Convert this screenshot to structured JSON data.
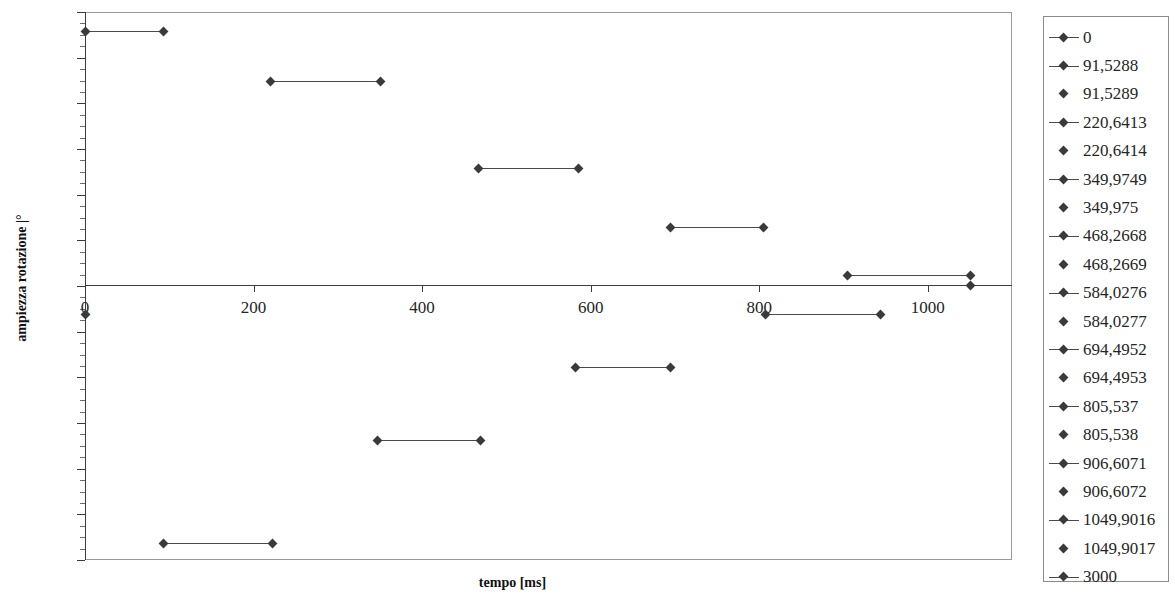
{
  "chart_data": {
    "type": "line",
    "title": "",
    "xlabel": "tempo [ms]",
    "ylabel": "ampiezza rotazione |°",
    "xlim": [
      0,
      1100
    ],
    "ylim": [
      -120,
      120
    ],
    "grid": false,
    "legend_position": "right",
    "x_ticks": [
      {
        "value": 0,
        "label": "0"
      },
      {
        "value": 200,
        "label": "200"
      },
      {
        "value": 400,
        "label": "400"
      },
      {
        "value": 600,
        "label": "600"
      },
      {
        "value": 800,
        "label": "800"
      },
      {
        "value": 1000,
        "label": "1000"
      }
    ],
    "y_ticks": [
      {
        "value": 120,
        "label": "120"
      },
      {
        "value": 100,
        "label": "100"
      },
      {
        "value": 80,
        "label": "80"
      },
      {
        "value": 60,
        "label": "60"
      },
      {
        "value": 40,
        "label": "40"
      },
      {
        "value": 20,
        "label": "20"
      },
      {
        "value": 0,
        "label": "0"
      },
      {
        "value": -20,
        "label": "-20"
      },
      {
        "value": -40,
        "label": "-40"
      },
      {
        "value": -60,
        "label": "-60"
      },
      {
        "value": -80,
        "label": "-80"
      },
      {
        "value": -100,
        "label": "-100"
      },
      {
        "value": -120,
        "label": "-120"
      }
    ],
    "y_minor_step": 5,
    "series": [
      {
        "name": "0",
        "key": "line-marker",
        "x": [
          0,
          91.5288
        ],
        "values": [
          112,
          112
        ]
      },
      {
        "name": "91,5288",
        "key": "line-marker",
        "x": [
          91.5289,
          220.6413
        ],
        "values": [
          90,
          90
        ]
      },
      {
        "name": "91,5289",
        "key": "marker",
        "x": [],
        "values": []
      },
      {
        "name": "220,6413",
        "key": "line-marker",
        "x": [
          220.6414,
          349.9749
        ],
        "values": [
          51.5,
          51.5
        ]
      },
      {
        "name": "220,6414",
        "key": "marker",
        "x": [],
        "values": []
      },
      {
        "name": "349,9749",
        "key": "line-marker",
        "x": [
          349.975,
          468.2668
        ],
        "values": [
          25,
          25
        ]
      },
      {
        "name": "349,975",
        "key": "marker",
        "x": [],
        "values": []
      },
      {
        "name": "468,2668",
        "key": "line-marker",
        "x": [
          468.2669,
          584.0276
        ],
        "values": [
          4.5,
          4.5
        ]
      },
      {
        "name": "468,2669",
        "key": "marker",
        "x": [],
        "values": []
      },
      {
        "name": "584,0276",
        "key": "line-marker",
        "x": [
          584.0277,
          694.4952
        ],
        "values": [
          -12,
          -12
        ]
      },
      {
        "name": "584,0277",
        "key": "marker",
        "x": [],
        "values": []
      },
      {
        "name": "694,4952",
        "key": "line-marker",
        "x": [
          694.4953,
          805.537
        ],
        "values": [
          -36.5,
          -36.5
        ]
      },
      {
        "name": "694,4953",
        "key": "marker",
        "x": [],
        "values": []
      },
      {
        "name": "805,537",
        "key": "line-marker",
        "x": [
          805.538,
          906.6071
        ],
        "values": [
          -68,
          -68
        ]
      },
      {
        "name": "805,538",
        "key": "marker",
        "x": [],
        "values": []
      },
      {
        "name": "906,6071",
        "key": "line-marker",
        "x": [
          906.6072,
          1049.9016
        ],
        "values": [
          -114,
          -114
        ]
      },
      {
        "name": "906,6072",
        "key": "marker",
        "x": [],
        "values": []
      },
      {
        "name": "1049,9016",
        "key": "line-marker",
        "x": [
          1049.9017,
          1050
        ],
        "values": [
          0,
          0
        ]
      },
      {
        "name": "1049,9017",
        "key": "marker",
        "x": [],
        "values": []
      },
      {
        "name": "3000",
        "key": "line-marker",
        "x": [],
        "values": []
      }
    ],
    "plotted_segments": [
      {
        "x0": 0,
        "x1": 92,
        "y": 112,
        "px0": 85,
        "px1": 163,
        "py": 31
      },
      {
        "x0": 220,
        "x1": 350,
        "y": 90,
        "px0": 270,
        "px1": 380,
        "py": 81
      },
      {
        "x0": 468,
        "x1": 584,
        "y": 51.5,
        "px0": 478,
        "px1": 578,
        "py": 168
      },
      {
        "x0": 694,
        "x1": 805,
        "y": 25,
        "px0": 670,
        "px1": 763,
        "py": 227
      },
      {
        "x0": 906,
        "x1": 1050,
        "y": 4.5,
        "px0": 847,
        "px1": 970,
        "py": 275
      },
      {
        "x0": 800,
        "x1": 906,
        "y": -12,
        "px0": 765,
        "px1": 880,
        "py": 314
      },
      {
        "x0": 584,
        "x1": 694,
        "y": -36.5,
        "px0": 575,
        "px1": 670,
        "py": 367
      },
      {
        "x0": 350,
        "x1": 468,
        "y": -68,
        "px0": 377,
        "px1": 480,
        "py": 440
      },
      {
        "x0": 92,
        "x1": 220,
        "y": -114,
        "px0": 163,
        "px1": 272,
        "py": 543
      }
    ],
    "extra_markers": [
      {
        "px": 970,
        "py": 285,
        "note": "zero-crossing point"
      },
      {
        "px": 85,
        "py": 314,
        "note": "point on y-axis at -12"
      }
    ],
    "accent_color": "#3a3a3a",
    "frame_color": "#9a9a9a"
  }
}
